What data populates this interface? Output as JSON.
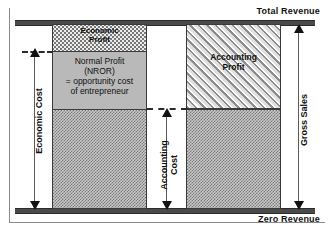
{
  "diagram": {
    "captions": {
      "top": "Total Revenue",
      "bottom": "Zero Revenue"
    },
    "columns": {
      "left": {
        "name": "economic-column",
        "segments": [
          {
            "id": "economic-profit",
            "label": "Economic\nProfit",
            "fill": "dotted",
            "fill_color": "#ececec"
          },
          {
            "id": "normal-profit",
            "label": "Normal Profit\n(NROR)\n= opportunity  cost\nof entrepreneur",
            "fill": "solid",
            "fill_color": "#b9b9b9"
          },
          {
            "id": "economic-cost-base",
            "label": "",
            "fill": "checkered",
            "fill_color": "#c9c9c9"
          }
        ]
      },
      "right": {
        "name": "accounting-column",
        "segments": [
          {
            "id": "accounting-profit",
            "label": "Accounting\nProfit",
            "fill": "diagonal-hatch",
            "fill_color": "#e4e4e4"
          },
          {
            "id": "accounting-cost-base",
            "label": "",
            "fill": "checkered",
            "fill_color": "#c9c9c9"
          }
        ]
      }
    },
    "measures": [
      {
        "id": "economic-cost",
        "label": "Economic Cost",
        "position": "left",
        "arrow": "double-headed"
      },
      {
        "id": "accounting-cost",
        "label": "Accounting\nCost",
        "position": "middle",
        "arrow": "double-headed"
      },
      {
        "id": "gross-sales",
        "label": "Gross Sales",
        "position": "right",
        "arrow": "double-headed"
      }
    ],
    "colors": {
      "rule": "#4a4a4a",
      "border": "#3a3a3a",
      "arrow": "#111111",
      "dash": "#2b2b2b",
      "text": "#101010",
      "background": "#ffffff"
    }
  }
}
